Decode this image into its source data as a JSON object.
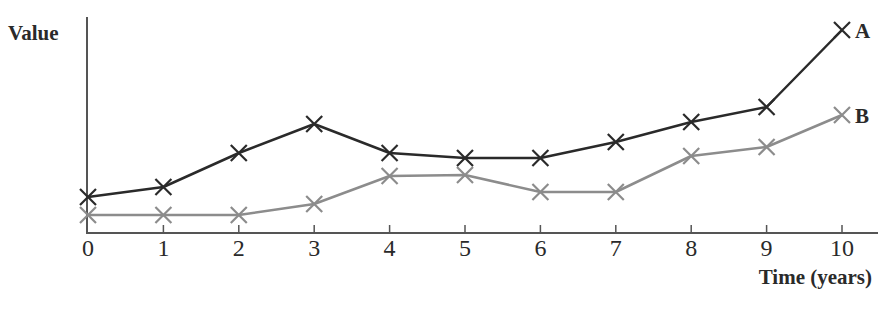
{
  "chart_data": {
    "type": "line",
    "title": "",
    "xlabel": "Time (years)",
    "ylabel": "Value",
    "x": [
      0,
      1,
      2,
      3,
      4,
      5,
      6,
      7,
      8,
      9,
      10
    ],
    "xticks": [
      "0",
      "1",
      "2",
      "3",
      "4",
      "5",
      "6",
      "7",
      "8",
      "9",
      "10"
    ],
    "yticks": [],
    "ylim": [
      0,
      21.6
    ],
    "xlim": [
      0,
      10.5
    ],
    "grid": false,
    "legend": "inline labels at line ends",
    "marker": "x",
    "series": [
      {
        "name": "A",
        "color": "#2a2a2a",
        "values": [
          3.6,
          4.6,
          8.0,
          10.9,
          8.0,
          7.5,
          7.5,
          9.1,
          11.1,
          12.6,
          20.3
        ]
      },
      {
        "name": "B",
        "color": "#8c8c8c",
        "values": [
          1.8,
          1.8,
          1.8,
          2.9,
          5.7,
          5.8,
          4.1,
          4.1,
          7.7,
          8.6,
          11.8
        ]
      }
    ]
  },
  "axes": {
    "ylabel": "Value",
    "xlabel": "Time (years)"
  },
  "colors": {
    "axis": "#555555",
    "series_a": "#2a2a2a",
    "series_b": "#8c8c8c",
    "text": "#2a2a2a"
  }
}
